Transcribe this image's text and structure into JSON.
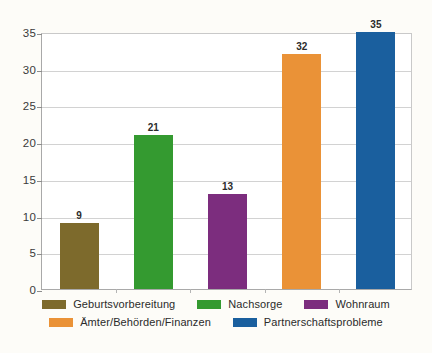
{
  "chart_data": {
    "type": "bar",
    "title": "",
    "subtitle": "",
    "xlabel": "",
    "ylabel": "",
    "categories": [
      "Geburtsvorbereitung",
      "Nachsorge",
      "Wohnraum",
      "Ämter/Behörden/Finanzen",
      "Partnerschaftsprobleme"
    ],
    "values": [
      9,
      21,
      13,
      32,
      35
    ],
    "data_labels": [
      "9",
      "21",
      "13",
      "32",
      "35"
    ],
    "colors": [
      "#7d6a2c",
      "#349a30",
      "#7c2d7e",
      "#ea9237",
      "#1a5f9e"
    ],
    "ylim": [
      0,
      35
    ],
    "yticks": [
      0,
      5,
      10,
      15,
      20,
      25,
      30,
      35
    ],
    "ytick_labels": [
      "0",
      "5",
      "10",
      "15",
      "20",
      "25",
      "30",
      "35"
    ],
    "grid": true,
    "grid_axis": "y",
    "legend_position": "bottom",
    "legend": [
      {
        "label": "Geburtsvorbereitung",
        "color": "#7d6a2c"
      },
      {
        "label": "Nachsorge",
        "color": "#349a30"
      },
      {
        "label": "Wohnraum",
        "color": "#7c2d7e"
      },
      {
        "label": "Ämter/Behörden/Finanzen",
        "color": "#ea9237"
      },
      {
        "label": "Partnerschaftsprobleme",
        "color": "#1a5f9e"
      }
    ],
    "legend_rows": [
      [
        {
          "label": "Geburtsvorbereitung",
          "color": "#7d6a2c"
        },
        {
          "label": "Nachsorge",
          "color": "#349a30"
        },
        {
          "label": "Wohnraum",
          "color": "#7c2d7e"
        }
      ],
      [
        {
          "label": "Ämter/Behörden/Finanzen",
          "color": "#ea9237"
        },
        {
          "label": "Partnerschaftsprobleme",
          "color": "#1a5f9e"
        }
      ]
    ],
    "background_color": "#fdfcf8",
    "plot_background_color": "#ffffff",
    "gridline_color": "#d2d2d2",
    "axis_color": "#a9a9a9"
  }
}
